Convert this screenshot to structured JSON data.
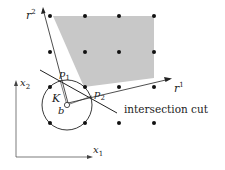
{
  "labels": {
    "r2": "r",
    "r2_sup": "2",
    "r1": "r",
    "r1_sup": "1",
    "x2": "x",
    "x2_sub": "2",
    "x1": "x",
    "x1_sub": "1",
    "p1": "p",
    "p1_sub": "1",
    "p2": "p",
    "p2_sub": "2",
    "K": "K",
    "b": "b",
    "cut": "intersection cut"
  },
  "colors": {
    "shade": "#c8c8c8",
    "line": "#222222",
    "dot": "#111111"
  },
  "lattice_points": [
    [
      50,
      16
    ],
    [
      85,
      16
    ],
    [
      119,
      16
    ],
    [
      154,
      16
    ],
    [
      50,
      52
    ],
    [
      85,
      52
    ],
    [
      119,
      52
    ],
    [
      154,
      52
    ],
    [
      85,
      87
    ],
    [
      119,
      87
    ],
    [
      154,
      87
    ],
    [
      50,
      123
    ],
    [
      85,
      123
    ],
    [
      119,
      123
    ],
    [
      154,
      123
    ],
    [
      50,
      87
    ]
  ]
}
